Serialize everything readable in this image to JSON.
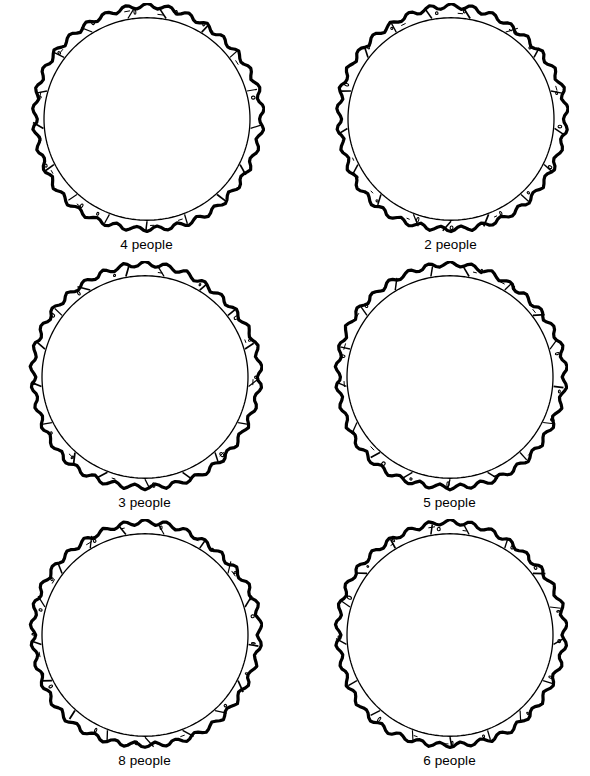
{
  "page": {
    "background_color": "#ffffff",
    "ink_color": "#000000",
    "width": 590,
    "height": 776,
    "columns": 2,
    "rows": 3
  },
  "figure": {
    "icon_name": "bamboo-ring-icon",
    "shape": "circle",
    "style": "black line art, scalloped outer edge, smooth inner circle, bamboo segment joints",
    "fill": "#ffffff",
    "stroke": "#000000",
    "outer_radius": 116,
    "inner_radius": 103,
    "scallop_count": 34,
    "segment_count": 17
  },
  "items": [
    {
      "id": "ring-1",
      "label": "4 people",
      "count": 4,
      "row": 1,
      "column": 1
    },
    {
      "id": "ring-2",
      "label": "2 people",
      "count": 2,
      "row": 1,
      "column": 2
    },
    {
      "id": "ring-3",
      "label": "3 people",
      "count": 3,
      "row": 2,
      "column": 1
    },
    {
      "id": "ring-4",
      "label": "5 people",
      "count": 5,
      "row": 2,
      "column": 2
    },
    {
      "id": "ring-5",
      "label": "8 people",
      "count": 8,
      "row": 3,
      "column": 1
    },
    {
      "id": "ring-6",
      "label": "6 people",
      "count": 6,
      "row": 3,
      "column": 2
    }
  ]
}
